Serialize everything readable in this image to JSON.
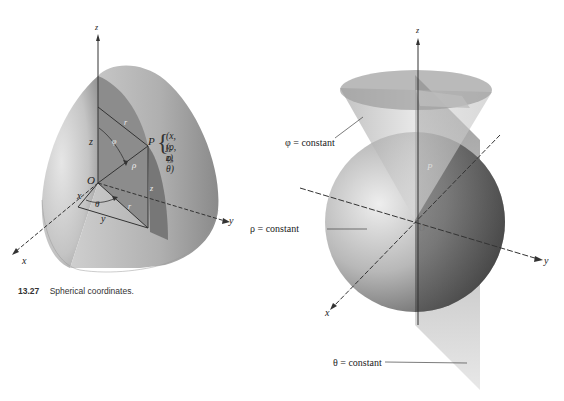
{
  "figure_left": {
    "caption_number": "13.27",
    "caption_text": "Spherical coordinates.",
    "labels": {
      "z_axis": "z",
      "y_axis": "y",
      "x_axis": "x",
      "origin": "O",
      "z_height": "z",
      "z_vertical": "z",
      "r_top": "r",
      "r_bottom": "r",
      "phi": "φ",
      "rho": "ρ",
      "theta": "θ",
      "x_len": "x",
      "y_len": "y",
      "point": "P",
      "point_cartesian": "(x, y, z)",
      "point_spherical": "(ρ, φ, θ)"
    }
  },
  "figure_right": {
    "labels": {
      "z_axis": "z",
      "y_axis": "y",
      "x_axis": "x",
      "origin": "O",
      "point": "P",
      "phi_constant": "φ = constant",
      "rho_constant": "ρ = constant",
      "theta_constant": "θ = constant"
    }
  }
}
